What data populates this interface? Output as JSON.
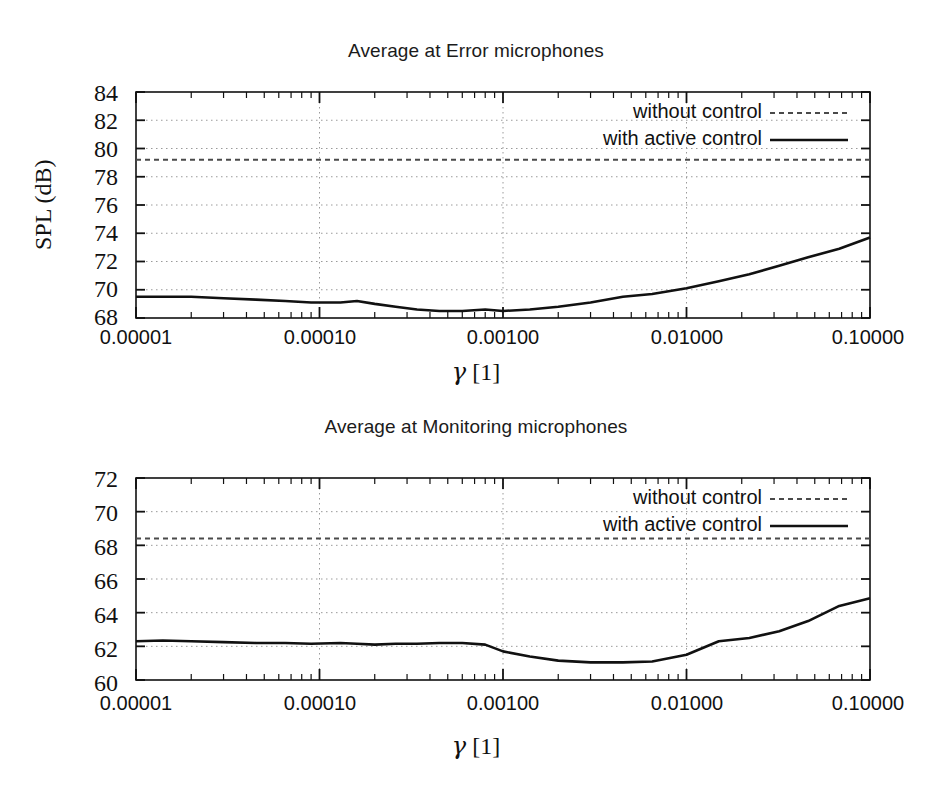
{
  "figure": {
    "background": "#ffffff",
    "ink_color": "#111111",
    "grid_color": "#9a9a9a"
  },
  "panels": [
    {
      "id": "error",
      "title": "Average at Error microphones",
      "ylabel": "SPL (dB)",
      "xlabel_symbol": "γ",
      "xlabel_unit": "[1]",
      "yticks": [
        "84",
        "82",
        "80",
        "78",
        "76",
        "74",
        "72",
        "70",
        "68"
      ],
      "xticks": [
        "0.00001",
        "0.00010",
        "0.00100",
        "0.01000",
        "0.10000"
      ],
      "legend": [
        {
          "label": "without control",
          "style": "dashed"
        },
        {
          "label": "with active control",
          "style": "solid"
        }
      ]
    },
    {
      "id": "monitoring",
      "title": "Average at Monitoring microphones",
      "ylabel": "SPL (dB)",
      "xlabel_symbol": "γ",
      "xlabel_unit": "[1]",
      "yticks": [
        "72",
        "70",
        "68",
        "66",
        "64",
        "62",
        "60"
      ],
      "xticks": [
        "0.00001",
        "0.00010",
        "0.00100",
        "0.01000",
        "0.10000"
      ],
      "legend": [
        {
          "label": "without control",
          "style": "dashed"
        },
        {
          "label": "with active control",
          "style": "solid"
        }
      ]
    }
  ],
  "chart_data": [
    {
      "type": "line",
      "id": "error",
      "title": "Average at Error microphones",
      "xlabel": "γ [1]",
      "ylabel": "SPL (dB)",
      "xscale": "log",
      "xlim": [
        1e-05,
        0.1
      ],
      "ylim": [
        68,
        84
      ],
      "yticks": [
        68,
        70,
        72,
        74,
        76,
        78,
        80,
        82,
        84
      ],
      "xticks": [
        1e-05,
        0.0001,
        0.001,
        0.01,
        0.1
      ],
      "grid": true,
      "legend_position": "top-right",
      "series": [
        {
          "name": "without control",
          "style": "dashed",
          "constant_value": 79.2,
          "x": [
            1e-05,
            0.1
          ],
          "values": [
            79.2,
            79.2
          ]
        },
        {
          "name": "with active control",
          "style": "solid",
          "x": [
            1e-05,
            1.4e-05,
            2e-05,
            3e-05,
            4.5e-05,
            6.5e-05,
            9e-05,
            0.00013,
            0.00016,
            0.0002,
            0.00026,
            0.00034,
            0.00045,
            0.0006,
            0.0008,
            0.001,
            0.0014,
            0.002,
            0.003,
            0.0045,
            0.0065,
            0.01,
            0.015,
            0.022,
            0.032,
            0.046,
            0.068,
            0.1
          ],
          "values": [
            69.5,
            69.5,
            69.5,
            69.4,
            69.3,
            69.2,
            69.1,
            69.1,
            69.2,
            69.0,
            68.8,
            68.6,
            68.5,
            68.5,
            68.6,
            68.5,
            68.6,
            68.8,
            69.1,
            69.5,
            69.7,
            70.1,
            70.6,
            71.1,
            71.7,
            72.3,
            72.9,
            73.7
          ]
        }
      ]
    },
    {
      "type": "line",
      "id": "monitoring",
      "title": "Average at Monitoring microphones",
      "xlabel": "γ [1]",
      "ylabel": "SPL (dB)",
      "xscale": "log",
      "xlim": [
        1e-05,
        0.1
      ],
      "ylim": [
        60,
        72
      ],
      "yticks": [
        60,
        62,
        64,
        66,
        68,
        70,
        72
      ],
      "xticks": [
        1e-05,
        0.0001,
        0.001,
        0.01,
        0.1
      ],
      "grid": true,
      "legend_position": "top-right",
      "series": [
        {
          "name": "without control",
          "style": "dashed",
          "constant_value": 68.4,
          "x": [
            1e-05,
            0.1
          ],
          "values": [
            68.4,
            68.4
          ]
        },
        {
          "name": "with active control",
          "style": "solid",
          "x": [
            1e-05,
            1.4e-05,
            2e-05,
            3e-05,
            4.5e-05,
            6.5e-05,
            9e-05,
            0.00013,
            0.00016,
            0.0002,
            0.00026,
            0.00034,
            0.00045,
            0.0006,
            0.0008,
            0.001,
            0.0014,
            0.002,
            0.003,
            0.0045,
            0.0065,
            0.01,
            0.015,
            0.022,
            0.032,
            0.046,
            0.068,
            0.1
          ],
          "values": [
            62.3,
            62.35,
            62.3,
            62.25,
            62.2,
            62.2,
            62.15,
            62.2,
            62.15,
            62.1,
            62.15,
            62.15,
            62.2,
            62.2,
            62.1,
            61.7,
            61.4,
            61.15,
            61.05,
            61.05,
            61.1,
            61.5,
            62.3,
            62.5,
            62.9,
            63.5,
            64.4,
            64.85
          ]
        }
      ]
    }
  ]
}
